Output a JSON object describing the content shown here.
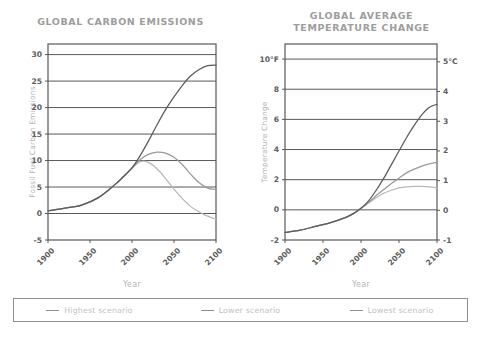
{
  "legend": {
    "items": [
      {
        "label": "Highest scenario",
        "color": "#5a5a5a"
      },
      {
        "label": "Lower scenario",
        "color": "#9a9a9a"
      },
      {
        "label": "Lowest scenario",
        "color": "#b8b8b8"
      }
    ]
  },
  "chart_data": [
    {
      "type": "line",
      "title": "GLOBAL CARBON EMISSIONS",
      "xlabel": "Year",
      "ylabel": "Fossil Fuel Carbon Emissions",
      "xlim": [
        1900,
        2100
      ],
      "ylim": [
        -5,
        32
      ],
      "xticks": [
        1900,
        1950,
        2000,
        2050,
        2100
      ],
      "xticklabels": [
        "1900",
        "1950",
        "2000",
        "2050",
        "2100"
      ],
      "yticks": [
        -5,
        0,
        5,
        10,
        15,
        20,
        25,
        30
      ],
      "yticklabels": [
        "-5",
        "0",
        "5",
        "10",
        "15",
        "20",
        "25",
        "30"
      ],
      "grid": "horizontal",
      "legend_position": "below-figure",
      "x": [
        1900,
        1920,
        1940,
        1960,
        1980,
        1990,
        2000,
        2010,
        2020,
        2030,
        2040,
        2050,
        2060,
        2070,
        2080,
        2090,
        2100
      ],
      "series": [
        {
          "name": "Highest scenario",
          "color": "#5a5a5a",
          "values": [
            0.5,
            1.0,
            1.6,
            3.0,
            5.5,
            7.0,
            8.6,
            11.0,
            13.8,
            16.8,
            19.6,
            22.0,
            24.2,
            26.0,
            27.2,
            27.9,
            28.0
          ]
        },
        {
          "name": "Lower scenario",
          "color": "#9a9a9a",
          "values": [
            0.5,
            1.0,
            1.6,
            3.0,
            5.5,
            7.0,
            8.6,
            10.2,
            11.2,
            11.6,
            11.4,
            10.6,
            9.2,
            7.4,
            5.8,
            4.8,
            4.5
          ]
        },
        {
          "name": "Lowest scenario",
          "color": "#b8b8b8",
          "values": [
            0.5,
            1.0,
            1.6,
            3.0,
            5.5,
            7.0,
            8.6,
            9.8,
            9.6,
            8.4,
            6.6,
            4.6,
            2.8,
            1.3,
            0.3,
            -0.5,
            -1.1
          ]
        }
      ]
    },
    {
      "type": "line",
      "title": "GLOBAL AVERAGE TEMPERATURE CHANGE",
      "title_lines": [
        "GLOBAL AVERAGE",
        "TEMPERATURE CHANGE"
      ],
      "xlabel": "Year",
      "ylabel": "Temperature Change",
      "xlim": [
        1900,
        2100
      ],
      "ylim": [
        -2,
        11
      ],
      "ylim_secondary": [
        -1,
        5.6
      ],
      "xticks": [
        1900,
        1950,
        2000,
        2050,
        2100
      ],
      "xticklabels": [
        "1900",
        "1950",
        "2000",
        "2050",
        "2100"
      ],
      "yticks": [
        -2,
        0,
        2,
        4,
        6,
        8,
        10
      ],
      "yticklabels": [
        "-2",
        "0",
        "2",
        "4",
        "6",
        "8",
        "10°F"
      ],
      "yticks_secondary": [
        -1,
        0,
        1,
        2,
        3,
        4,
        5
      ],
      "yticklabels_secondary": [
        "-1",
        "0",
        "1",
        "2",
        "3",
        "4",
        "5°C"
      ],
      "grid": "horizontal",
      "legend_position": "below-figure",
      "x": [
        1900,
        1920,
        1940,
        1960,
        1980,
        1990,
        2000,
        2010,
        2020,
        2030,
        2040,
        2050,
        2060,
        2070,
        2080,
        2090,
        2100
      ],
      "series": [
        {
          "name": "Highest scenario",
          "color": "#5a5a5a",
          "values": [
            -1.5,
            -1.35,
            -1.1,
            -0.85,
            -0.5,
            -0.25,
            0.1,
            0.6,
            1.3,
            2.1,
            3.0,
            3.9,
            4.8,
            5.6,
            6.3,
            6.8,
            7.0
          ]
        },
        {
          "name": "Lower scenario",
          "color": "#9a9a9a",
          "values": [
            -1.5,
            -1.35,
            -1.1,
            -0.85,
            -0.5,
            -0.25,
            0.1,
            0.5,
            0.95,
            1.35,
            1.75,
            2.1,
            2.45,
            2.7,
            2.9,
            3.05,
            3.15
          ]
        },
        {
          "name": "Lowest scenario",
          "color": "#b8b8b8",
          "values": [
            -1.5,
            -1.35,
            -1.1,
            -0.85,
            -0.5,
            -0.25,
            0.1,
            0.45,
            0.8,
            1.1,
            1.3,
            1.45,
            1.52,
            1.55,
            1.55,
            1.52,
            1.45
          ]
        }
      ]
    }
  ]
}
